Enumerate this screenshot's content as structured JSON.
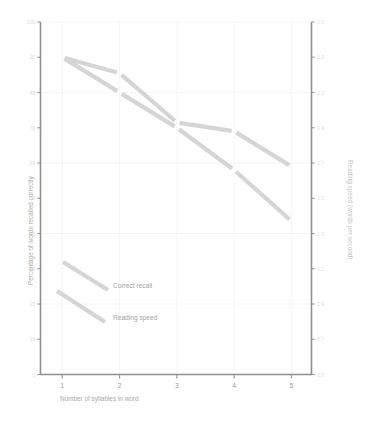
{
  "chart_data": {
    "type": "line",
    "title": "",
    "xlabel": "Number of syllables in word",
    "ylabel": "Percentage of words recalled correctly",
    "y2label": "Reading speed (words per second)",
    "x": [
      1,
      2,
      3,
      4,
      5
    ],
    "xticklabels": [
      "1",
      "2",
      "3",
      "4",
      "5"
    ],
    "xlim": [
      0.62,
      5.35
    ],
    "ylim": [
      0,
      100
    ],
    "yticks": [
      0,
      10,
      20,
      30,
      40,
      50,
      60,
      70,
      80,
      90,
      100
    ],
    "yticklabels": [
      "0",
      "10",
      "20",
      "30",
      "40",
      "50",
      "60",
      "70",
      "80",
      "90",
      "100"
    ],
    "y2lim": [
      0.5,
      2.5
    ],
    "y2ticks": [
      0.5,
      0.7,
      0.9,
      1.1,
      1.3,
      1.5,
      1.7,
      1.9,
      2.1,
      2.3,
      2.5
    ],
    "y2ticklabels": [
      "0.5",
      "0.7",
      "0.9",
      "1.1",
      "1.3",
      "1.5",
      "1.7",
      "1.9",
      "2.1",
      "2.3",
      "2.5"
    ],
    "grid": true,
    "legend_position": "inside-lower-left",
    "series": [
      {
        "name": "Correct recall",
        "axis": "left",
        "values": [
          90,
          85.5,
          71.5,
          69,
          59
        ],
        "color": "#d5d5d5"
      },
      {
        "name": "Reading speed",
        "axis": "right",
        "values": [
          2.3,
          2.1,
          1.9,
          1.66,
          1.37
        ],
        "color": "#d5d5d5"
      }
    ]
  },
  "legend": {
    "items": [
      {
        "label": "Correct recall"
      },
      {
        "label": "Reading speed"
      }
    ]
  }
}
